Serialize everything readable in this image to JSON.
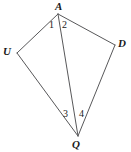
{
  "figure": {
    "background_color": "#ffffff",
    "stroke_color": "#58585a",
    "text_color": "#1a1a1a",
    "stroke_width": 1,
    "width": 131,
    "height": 152
  },
  "vertices": [
    {
      "id": "A",
      "label": "A",
      "x": 58,
      "y": 14,
      "label_x": 55,
      "label_y": 1
    },
    {
      "id": "U",
      "label": "U",
      "x": 17,
      "y": 53,
      "label_x": 3,
      "label_y": 46
    },
    {
      "id": "D",
      "label": "D",
      "x": 115,
      "y": 45,
      "label_x": 118,
      "label_y": 38
    },
    {
      "id": "Q",
      "label": "Q",
      "x": 78,
      "y": 136,
      "label_x": 72,
      "label_y": 139
    }
  ],
  "edges": [
    {
      "id": "AU",
      "from": "A",
      "to": "U"
    },
    {
      "id": "AD",
      "from": "A",
      "to": "D"
    },
    {
      "id": "AQ",
      "from": "A",
      "to": "Q",
      "role": "diagonal"
    },
    {
      "id": "UQ",
      "from": "U",
      "to": "Q"
    },
    {
      "id": "DQ",
      "from": "D",
      "to": "Q"
    }
  ],
  "angle_labels": [
    {
      "id": "angle-1",
      "text": "1",
      "at_vertex": "A",
      "x": 49,
      "y": 20
    },
    {
      "id": "angle-2",
      "text": "2",
      "at_vertex": "A",
      "x": 62,
      "y": 20
    },
    {
      "id": "angle-3",
      "text": "3",
      "at_vertex": "Q",
      "x": 63,
      "y": 109
    },
    {
      "id": "angle-4",
      "text": "4",
      "at_vertex": "Q",
      "x": 79,
      "y": 109
    }
  ]
}
